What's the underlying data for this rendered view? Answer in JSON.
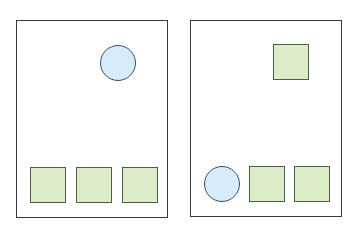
{
  "colors": {
    "panel_border": "#3a3a3a",
    "square_fill": "#dcecc8",
    "square_border": "#4a6040",
    "circle_fill": "#d8ebf8",
    "circle_border": "#3a4a6a"
  },
  "panels": [
    {
      "name": "left-panel",
      "shapes": [
        {
          "type": "circle",
          "position": "top-right"
        },
        {
          "type": "square",
          "position": "bottom-1"
        },
        {
          "type": "square",
          "position": "bottom-2"
        },
        {
          "type": "square",
          "position": "bottom-3"
        }
      ]
    },
    {
      "name": "right-panel",
      "shapes": [
        {
          "type": "square",
          "position": "top-right"
        },
        {
          "type": "circle",
          "position": "bottom-1"
        },
        {
          "type": "square",
          "position": "bottom-2"
        },
        {
          "type": "square",
          "position": "bottom-3"
        }
      ]
    }
  ]
}
